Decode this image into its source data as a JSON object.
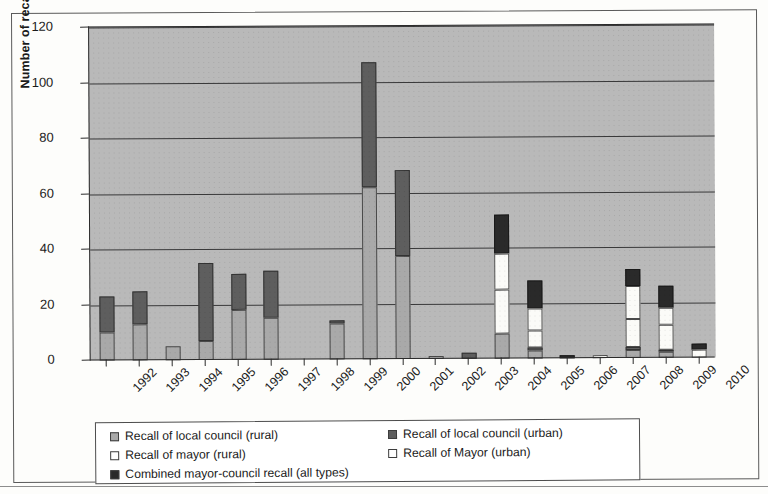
{
  "chart_data": {
    "type": "bar",
    "stacked": true,
    "title": "",
    "xlabel": "",
    "ylabel": "Number of recall votes",
    "ylim": [
      0,
      120
    ],
    "yticks": [
      0,
      20,
      40,
      60,
      80,
      100,
      120
    ],
    "grid": true,
    "legend_position": "bottom",
    "categories": [
      "1992",
      "1993",
      "1994",
      "1995",
      "1996",
      "1997",
      "1998",
      "1999",
      "2000",
      "2001",
      "2002",
      "2003",
      "2004",
      "2005",
      "2006",
      "2007",
      "2008",
      "2009",
      "2010"
    ],
    "series": [
      {
        "name": "Recall of local council (rural)",
        "color": "#a9a9a9",
        "values": [
          10,
          13,
          5,
          7,
          18,
          15,
          0,
          13,
          62,
          37,
          1,
          0,
          9,
          3,
          0,
          0,
          3,
          2,
          0
        ]
      },
      {
        "name": "Recall of local council (urban)",
        "color": "#5e5e5e",
        "values": [
          13,
          12,
          0,
          28,
          13,
          17,
          0,
          1,
          45,
          31,
          0,
          2,
          0,
          1,
          0,
          0,
          1,
          1,
          0
        ]
      },
      {
        "name": "Recall of mayor (rural)",
        "color": "#ffffff",
        "values": [
          0,
          0,
          0,
          0,
          0,
          0,
          0,
          0,
          0,
          0,
          0,
          0,
          16,
          6,
          0,
          1,
          10,
          9,
          3
        ]
      },
      {
        "name": "Recall of Mayor (urban)",
        "color": "#ffffff",
        "values": [
          0,
          0,
          0,
          0,
          0,
          0,
          0,
          0,
          0,
          0,
          0,
          0,
          13,
          8,
          0,
          0,
          12,
          6,
          0
        ]
      },
      {
        "name": "Combined mayor-council recall (all types)",
        "color": "#2a2a2a",
        "values": [
          0,
          0,
          0,
          0,
          0,
          0,
          0,
          0,
          0,
          0,
          0,
          0,
          14,
          10,
          1,
          0,
          6,
          8,
          2
        ]
      }
    ],
    "totals": [
      23,
      25,
      5,
      35,
      31,
      32,
      0,
      14,
      107,
      68,
      1,
      2,
      52,
      28,
      1,
      1,
      32,
      26,
      5
    ]
  },
  "axis": {
    "y_title": "Number of recall votes"
  },
  "legend": {
    "entries": [
      {
        "label": "Recall of local council (rural)",
        "swatch": "light-gray-swatch"
      },
      {
        "label": "Recall of local council (urban)",
        "swatch": "dark-gray-swatch"
      },
      {
        "label": "Recall of mayor (rural)",
        "swatch": "white-swatch"
      },
      {
        "label": "Recall of Mayor (urban)",
        "swatch": "white-swatch"
      },
      {
        "label": "Combined mayor-council recall (all types)",
        "swatch": "black-swatch"
      }
    ]
  }
}
